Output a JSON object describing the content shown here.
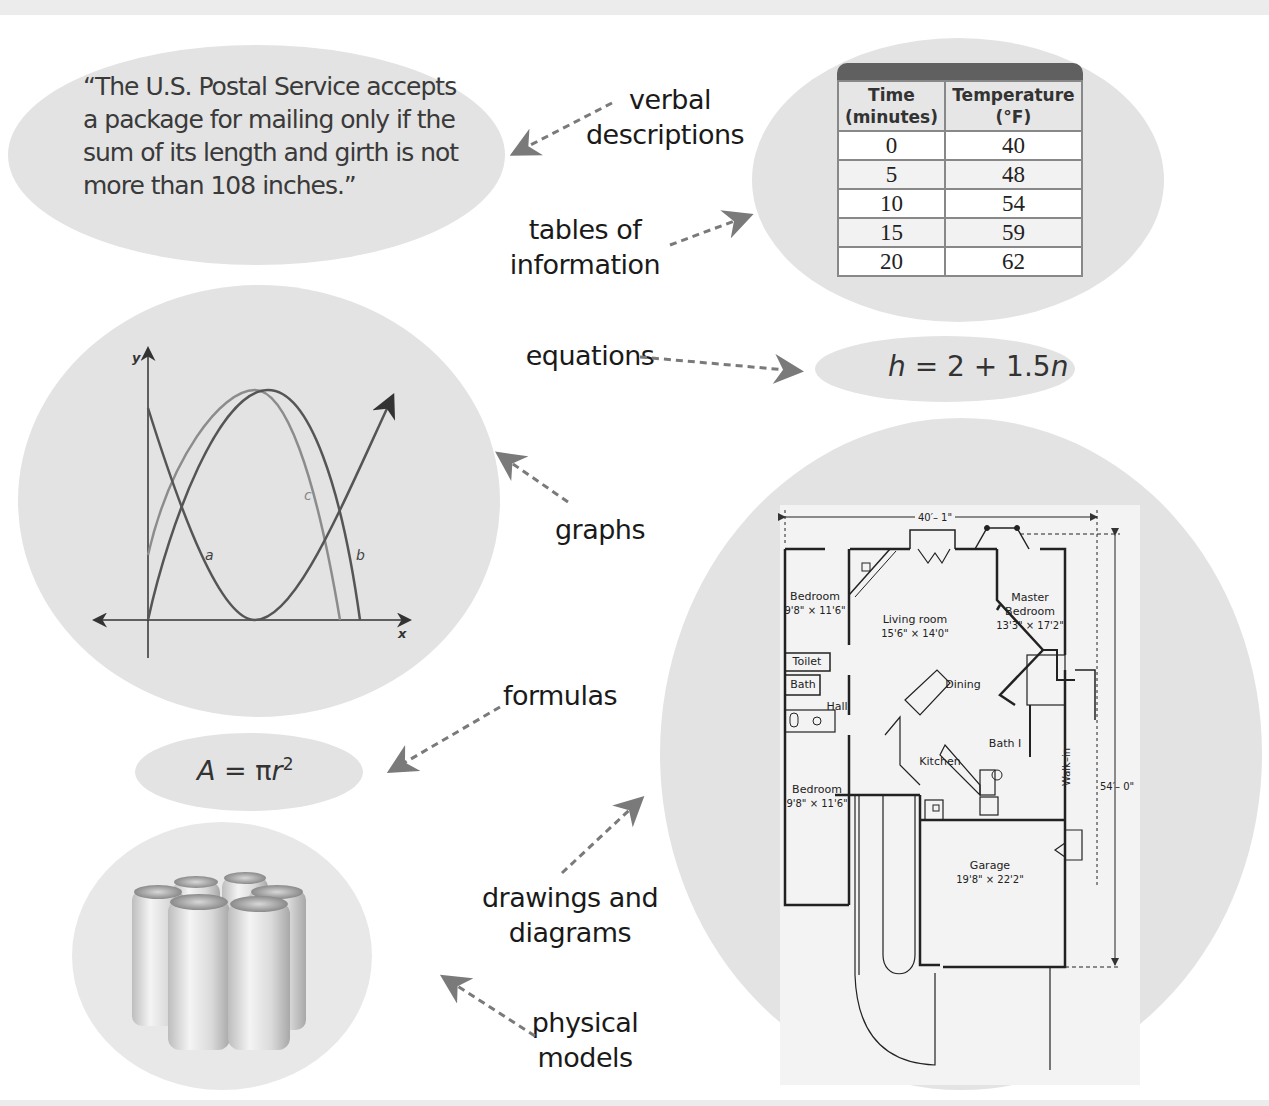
{
  "representations": {
    "verbal": {
      "label_line1": "verbal",
      "label_line2": "descriptions",
      "quote_line1": "“The U.S. Postal Service accepts",
      "quote_line2": "a package for mailing only if the",
      "quote_line3": "sum of its length and girth is not",
      "quote_line4": "more than 108 inches.”"
    },
    "tables": {
      "label_line1": "tables of",
      "label_line2": "information",
      "headers": [
        {
          "line1": "Time",
          "line2": "(minutes)"
        },
        {
          "line1": "Temperature",
          "line2": "(°F)"
        }
      ],
      "rows": [
        [
          "0",
          "40"
        ],
        [
          "5",
          "48"
        ],
        [
          "10",
          "54"
        ],
        [
          "15",
          "59"
        ],
        [
          "20",
          "62"
        ]
      ]
    },
    "equations": {
      "label": "equations",
      "lhs": "h",
      "middle": " = 2 + 1.5",
      "var": "n"
    },
    "graphs": {
      "label": "graphs",
      "y_axis": "y",
      "x_axis": "x",
      "curve_labels": [
        "a",
        "b",
        "c"
      ]
    },
    "formulas": {
      "label": "formulas",
      "lhs": "A",
      "middle": " = π",
      "var": "r",
      "exp": "2"
    },
    "drawings": {
      "label_line1": "drawings and",
      "label_line2": "diagrams",
      "width_dim": "40′– 1\"",
      "height_dim": "54′– 0\"",
      "rooms": [
        {
          "name": "Bedroom",
          "size": "9'8\" × 11'6\""
        },
        {
          "name": "Living room",
          "size": "15'6\" × 14'0\""
        },
        {
          "name": "Master",
          "size": "Bedroom"
        },
        {
          "name": "",
          "size": "13'3\" × 17'2\""
        },
        {
          "name": "Toilet",
          "size": ""
        },
        {
          "name": "Bath",
          "size": ""
        },
        {
          "name": "Hall",
          "size": ""
        },
        {
          "name": "Dining",
          "size": ""
        },
        {
          "name": "Bath I",
          "size": ""
        },
        {
          "name": "Kitchen",
          "size": ""
        },
        {
          "name": "Walk–in",
          "size": ""
        },
        {
          "name": "Bedroom",
          "size": "9'8\" × 11'6\""
        },
        {
          "name": "Garage",
          "size": "19'8\" × 22'2\""
        }
      ]
    },
    "physical": {
      "label_line1": "physical",
      "label_line2": "models"
    }
  },
  "colors": {
    "blob": "#e3e3e3",
    "arrow": "#7a7a7a",
    "table_header_bar": "#606060",
    "text": "#1a1a1a"
  }
}
